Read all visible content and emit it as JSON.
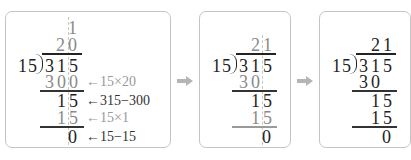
{
  "diagram": {
    "colors": {
      "ink": "#222222",
      "gray_ink": "#8a8a8a",
      "border": "#c4c4c4",
      "arrow": "#b5b5b5"
    },
    "panels": [
      {
        "id": "panel-1",
        "divisor": "15",
        "dividend": "315",
        "quotient_partials": [
          "1",
          "20"
        ],
        "steps": [
          {
            "value": "300",
            "annotation": "←15×20",
            "style": "gray"
          },
          {
            "value": "15",
            "annotation": "←315−300",
            "style": "black"
          },
          {
            "value": "15",
            "annotation": "←15×1",
            "style": "gray"
          },
          {
            "value": "0",
            "annotation": "←15−15",
            "style": "black"
          }
        ]
      },
      {
        "id": "panel-2",
        "divisor": "15",
        "dividend": "315",
        "quotient": "21",
        "steps": [
          {
            "value": "30",
            "style": "gray"
          },
          {
            "value": "15",
            "style": "black"
          },
          {
            "value": "15",
            "style": "gray"
          },
          {
            "value": "0",
            "style": "black"
          }
        ]
      },
      {
        "id": "panel-3",
        "divisor": "15",
        "dividend": "315",
        "quotient": "21",
        "steps": [
          {
            "value": "30",
            "style": "black"
          },
          {
            "value": "15",
            "style": "black"
          },
          {
            "value": "15",
            "style": "black"
          },
          {
            "value": "0",
            "style": "black"
          }
        ]
      }
    ],
    "arrows": [
      "right-arrow",
      "right-arrow"
    ]
  }
}
